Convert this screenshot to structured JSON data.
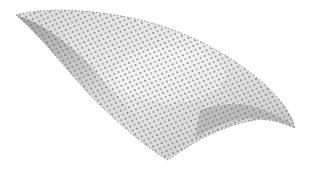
{
  "scene": {
    "description": "3D rendered curved triangulated mesh surface with vertex points",
    "background": "#ffffff",
    "surface_colors": {
      "light": "#ececec",
      "mid": "#bdbdbd",
      "dark": "#8a8a8a"
    },
    "vertex_color": "#6e6e6e"
  }
}
